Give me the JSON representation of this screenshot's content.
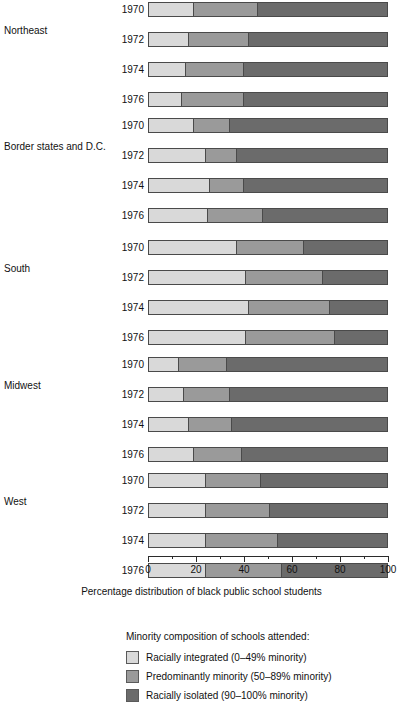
{
  "chart_data": {
    "type": "bar",
    "orientation": "horizontal",
    "stacked": true,
    "title": "",
    "xlabel": "Percentage distribution of black public school students",
    "ylabel": "",
    "xlim": [
      0,
      100
    ],
    "xticks": [
      0,
      20,
      40,
      60,
      80,
      100
    ],
    "xtick_labels": [
      "0",
      "20",
      "40",
      "60",
      "80",
      "100"
    ],
    "minor_tick_step": 10,
    "grid": false,
    "legend_position": "bottom",
    "legend_title": "Minority composition of schools attended:",
    "series": [
      {
        "name": "Racially integrated (0–49% minority)",
        "key": "integrated",
        "color": "#d9d9d9",
        "values": [
          19,
          17,
          16,
          14,
          19,
          24,
          26,
          25,
          37,
          41,
          42,
          41,
          13,
          15,
          17,
          19,
          24,
          24,
          24,
          24
        ]
      },
      {
        "name": "Predominantly minority (50–89% minority)",
        "key": "predominantly",
        "color": "#9a9a9a",
        "values": [
          27,
          25,
          24,
          26,
          15,
          13,
          14,
          23,
          28,
          32,
          34,
          37,
          20,
          19,
          18,
          20,
          23,
          27,
          30,
          32
        ]
      },
      {
        "name": "Racially isolated (90–100% minority)",
        "key": "isolated",
        "color": "#6b6b6b",
        "values": [
          54,
          58,
          60,
          60,
          66,
          63,
          60,
          52,
          35,
          27,
          24,
          22,
          67,
          66,
          65,
          61,
          53,
          49,
          46,
          44
        ]
      }
    ],
    "groups": [
      {
        "label": "Northeast",
        "rows": [
          {
            "year": "1970",
            "integrated": 19,
            "predominantly": 27,
            "isolated": 54
          },
          {
            "year": "1972",
            "integrated": 17,
            "predominantly": 25,
            "isolated": 58
          },
          {
            "year": "1974",
            "integrated": 16,
            "predominantly": 24,
            "isolated": 60
          },
          {
            "year": "1976",
            "integrated": 14,
            "predominantly": 26,
            "isolated": 60
          }
        ]
      },
      {
        "label": "Border states and D.C.",
        "rows": [
          {
            "year": "1970",
            "integrated": 19,
            "predominantly": 15,
            "isolated": 66
          },
          {
            "year": "1972",
            "integrated": 24,
            "predominantly": 13,
            "isolated": 63
          },
          {
            "year": "1974",
            "integrated": 26,
            "predominantly": 14,
            "isolated": 60
          },
          {
            "year": "1976",
            "integrated": 25,
            "predominantly": 23,
            "isolated": 52
          }
        ]
      },
      {
        "label": "South",
        "rows": [
          {
            "year": "1970",
            "integrated": 37,
            "predominantly": 28,
            "isolated": 35
          },
          {
            "year": "1972",
            "integrated": 41,
            "predominantly": 32,
            "isolated": 27
          },
          {
            "year": "1974",
            "integrated": 42,
            "predominantly": 34,
            "isolated": 24
          },
          {
            "year": "1976",
            "integrated": 41,
            "predominantly": 37,
            "isolated": 22
          }
        ]
      },
      {
        "label": "Midwest",
        "rows": [
          {
            "year": "1970",
            "integrated": 13,
            "predominantly": 20,
            "isolated": 67
          },
          {
            "year": "1972",
            "integrated": 15,
            "predominantly": 19,
            "isolated": 66
          },
          {
            "year": "1974",
            "integrated": 17,
            "predominantly": 18,
            "isolated": 65
          },
          {
            "year": "1976",
            "integrated": 19,
            "predominantly": 20,
            "isolated": 61
          }
        ]
      },
      {
        "label": "West",
        "rows": [
          {
            "year": "1970",
            "integrated": 24,
            "predominantly": 23,
            "isolated": 53
          },
          {
            "year": "1972",
            "integrated": 24,
            "predominantly": 27,
            "isolated": 49
          },
          {
            "year": "1974",
            "integrated": 24,
            "predominantly": 30,
            "isolated": 46
          },
          {
            "year": "1976",
            "integrated": 24,
            "predominantly": 32,
            "isolated": 44
          }
        ]
      }
    ],
    "legend_order": [
      "integrated",
      "predominantly",
      "isolated"
    ]
  },
  "layout": {
    "group_tops": [
      2,
      118,
      240,
      357,
      473
    ],
    "plot_left": 148,
    "plot_width": 240,
    "row_height": 15
  }
}
